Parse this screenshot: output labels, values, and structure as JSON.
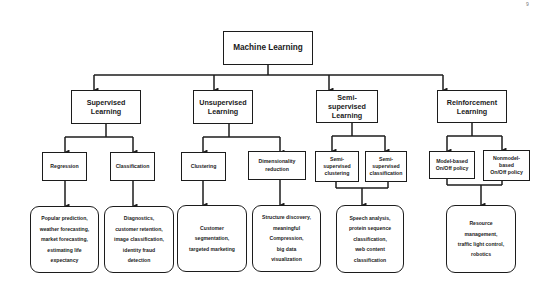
{
  "page_number": "9",
  "root": {
    "label": "Machine Learning"
  },
  "categories": [
    {
      "label_lines": [
        "Supervised",
        "Learning"
      ],
      "children": [
        {
          "label_lines": [
            "Regression"
          ]
        },
        {
          "label_lines": [
            "Classification"
          ]
        }
      ]
    },
    {
      "label_lines": [
        "Unsupervised",
        "Learning"
      ],
      "children": [
        {
          "label_lines": [
            "Clustering"
          ]
        },
        {
          "label_lines": [
            "Dimensionality",
            "reduction"
          ]
        }
      ]
    },
    {
      "label_lines": [
        "Semi-supervised",
        "Learning"
      ],
      "children": [
        {
          "label_lines": [
            "Semi-",
            "supervised",
            "clustering"
          ]
        },
        {
          "label_lines": [
            "Semi-",
            "supervised",
            "classification"
          ]
        }
      ]
    },
    {
      "label_lines": [
        "Reinforcement",
        "Learning"
      ],
      "children": [
        {
          "label_lines": [
            "Model-based",
            "On/Off policy"
          ]
        },
        {
          "label_lines": [
            "Nonmodel-",
            "based",
            "On/Off policy"
          ]
        }
      ]
    }
  ],
  "applications": [
    {
      "lines": [
        "Popular prediction,",
        "weather forecasting,",
        "market forecasting,",
        "estimating life",
        "expectancy"
      ]
    },
    {
      "lines": [
        "Diagnostics,",
        "customer retention,",
        "image classification,",
        "identity fraud",
        "detection"
      ]
    },
    {
      "lines": [
        "Customer",
        "segmentation,",
        "targeted marketing"
      ]
    },
    {
      "lines": [
        "Structure discovery,",
        "meaningful",
        "Compression,",
        "big data",
        "visualization"
      ]
    },
    {
      "lines": [
        "Speech analysis,",
        "protein sequence",
        "classification,",
        "web content",
        "classification"
      ]
    },
    {
      "lines": [
        "Resource",
        "management,",
        "traffic light control,",
        "robotics"
      ]
    }
  ],
  "colors": {
    "line": "#1c1c1c",
    "background": "#ffffff"
  }
}
